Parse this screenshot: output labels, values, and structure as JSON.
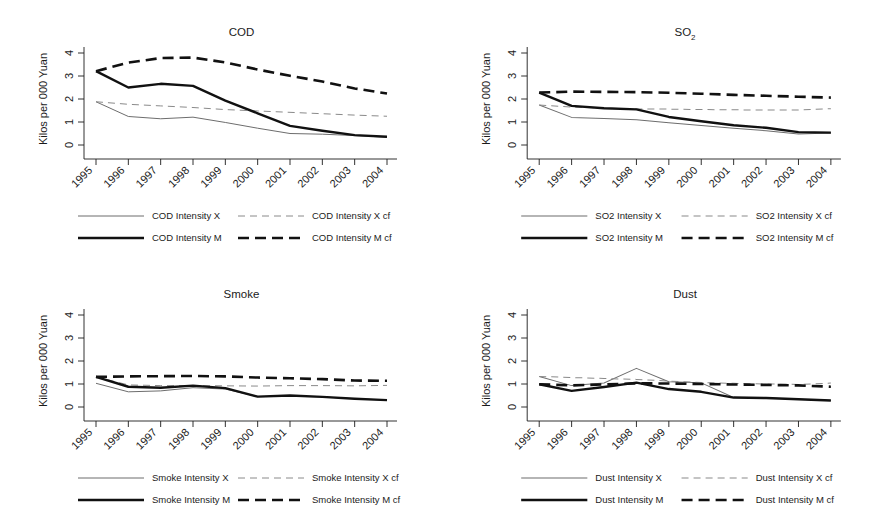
{
  "figure": {
    "axis_label": "Kilos per 000 Yuan",
    "years": [
      "1995",
      "1996",
      "1997",
      "1998",
      "1999",
      "2000",
      "2001",
      "2002",
      "2003",
      "2004"
    ],
    "ytick_labels": [
      "0",
      "1",
      "2",
      "3",
      "4"
    ],
    "colors": {
      "thin": "#6d6d6d",
      "thick": "#111111",
      "thin_dash": "#8a8a8a",
      "thick_dash": "#111111",
      "axis": "#1b1b1b",
      "background": "#ffffff"
    }
  },
  "chart_data": [
    {
      "type": "line",
      "title": "COD",
      "title_sub": "",
      "xlabel": "",
      "ylabel": "Kilos per 000 Yuan",
      "categories": [
        "1995",
        "1996",
        "1997",
        "1998",
        "1999",
        "2000",
        "2001",
        "2002",
        "2003",
        "2004"
      ],
      "ylim": [
        0,
        4
      ],
      "yticks": [
        0,
        1,
        2,
        3,
        4
      ],
      "grid": false,
      "legend_position": "bottom",
      "series": [
        {
          "name": "COD Intensity X",
          "style": "thin",
          "values": [
            1.88,
            1.24,
            1.14,
            1.21,
            0.98,
            0.73,
            0.5,
            0.47,
            0.41,
            0.34
          ]
        },
        {
          "name": "COD Intensity X cf",
          "style": "thin-dash",
          "values": [
            1.88,
            1.77,
            1.7,
            1.63,
            1.54,
            1.48,
            1.42,
            1.36,
            1.3,
            1.25
          ]
        },
        {
          "name": "COD Intensity M",
          "style": "thick",
          "values": [
            3.21,
            2.5,
            2.66,
            2.57,
            1.93,
            1.38,
            0.83,
            0.62,
            0.43,
            0.36
          ]
        },
        {
          "name": "COD Intensity M cf",
          "style": "thick-dash",
          "values": [
            3.21,
            3.58,
            3.78,
            3.8,
            3.59,
            3.28,
            3.01,
            2.76,
            2.46,
            2.24
          ]
        }
      ]
    },
    {
      "type": "line",
      "title": "SO",
      "title_sub": "2",
      "xlabel": "",
      "ylabel": "Kilos per 000 Yuan",
      "categories": [
        "1995",
        "1996",
        "1997",
        "1998",
        "1999",
        "2000",
        "2001",
        "2002",
        "2003",
        "2004"
      ],
      "ylim": [
        0,
        4
      ],
      "yticks": [
        0,
        1,
        2,
        3,
        4
      ],
      "grid": false,
      "legend_position": "bottom",
      "series": [
        {
          "name": "SO2 Intensity X",
          "style": "thin",
          "values": [
            1.74,
            1.2,
            1.15,
            1.1,
            0.97,
            0.85,
            0.73,
            0.62,
            0.48,
            0.52
          ]
        },
        {
          "name": "SO2 Intensity X cf",
          "style": "thin-dash",
          "values": [
            1.74,
            1.65,
            1.6,
            1.57,
            1.56,
            1.54,
            1.53,
            1.52,
            1.52,
            1.58
          ]
        },
        {
          "name": "SO2 Intensity M",
          "style": "thick",
          "values": [
            2.28,
            1.7,
            1.6,
            1.55,
            1.22,
            1.03,
            0.86,
            0.75,
            0.56,
            0.54
          ]
        },
        {
          "name": "SO2 Intensity M cf",
          "style": "thick-dash",
          "values": [
            2.28,
            2.32,
            2.31,
            2.3,
            2.27,
            2.23,
            2.18,
            2.14,
            2.1,
            2.06
          ]
        }
      ]
    },
    {
      "type": "line",
      "title": "Smoke",
      "title_sub": "",
      "xlabel": "",
      "ylabel": "Kilos per 000 Yuan",
      "categories": [
        "1995",
        "1996",
        "1997",
        "1998",
        "1999",
        "2000",
        "2001",
        "2002",
        "2003",
        "2004"
      ],
      "ylim": [
        0,
        4
      ],
      "yticks": [
        0,
        1,
        2,
        3,
        4
      ],
      "grid": false,
      "legend_position": "bottom",
      "series": [
        {
          "name": "Smoke Intensity X",
          "style": "thin",
          "values": [
            1.03,
            0.66,
            0.7,
            0.84,
            0.78,
            0.45,
            0.47,
            0.44,
            0.36,
            0.3
          ]
        },
        {
          "name": "Smoke Intensity X cf",
          "style": "thin-dash",
          "values": [
            1.31,
            0.96,
            0.93,
            0.93,
            0.92,
            0.91,
            0.93,
            0.93,
            0.92,
            0.94
          ]
        },
        {
          "name": "Smoke Intensity M",
          "style": "thick",
          "values": [
            1.31,
            0.88,
            0.84,
            0.93,
            0.82,
            0.45,
            0.5,
            0.44,
            0.36,
            0.3
          ]
        },
        {
          "name": "Smoke Intensity M cf",
          "style": "thick-dash",
          "values": [
            1.31,
            1.33,
            1.34,
            1.35,
            1.33,
            1.28,
            1.25,
            1.21,
            1.15,
            1.14
          ]
        }
      ]
    },
    {
      "type": "line",
      "title": "Dust",
      "title_sub": "",
      "xlabel": "",
      "ylabel": "Kilos per 000 Yuan",
      "categories": [
        "1995",
        "1996",
        "1997",
        "1998",
        "1999",
        "2000",
        "2001",
        "2002",
        "2003",
        "2004"
      ],
      "ylim": [
        0,
        4
      ],
      "yticks": [
        0,
        1,
        2,
        3,
        4
      ],
      "grid": false,
      "legend_position": "bottom",
      "series": [
        {
          "name": "Dust Intensity X",
          "style": "thin",
          "values": [
            1.33,
            0.93,
            1.04,
            1.68,
            1.1,
            1.05,
            0.41,
            0.39,
            0.34,
            0.28
          ]
        },
        {
          "name": "Dust Intensity X cf",
          "style": "thin-dash",
          "values": [
            1.33,
            1.28,
            1.24,
            1.2,
            1.13,
            1.06,
            1.03,
            1.0,
            0.98,
            1.04
          ]
        },
        {
          "name": "Dust Intensity M",
          "style": "thick",
          "values": [
            0.99,
            0.7,
            0.87,
            1.06,
            0.78,
            0.66,
            0.41,
            0.39,
            0.34,
            0.28
          ]
        },
        {
          "name": "Dust Intensity M cf",
          "style": "thick-dash",
          "values": [
            0.99,
            0.94,
            0.98,
            1.03,
            1.02,
            1.0,
            0.98,
            0.96,
            0.94,
            0.88
          ]
        }
      ]
    }
  ]
}
